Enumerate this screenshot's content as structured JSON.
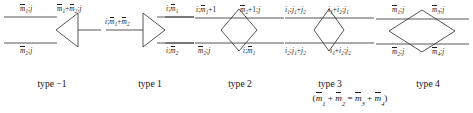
{
  "figure": {
    "kind": "vertex-type-diagram",
    "background": "#ffffff",
    "line_color": "#2b2b2b",
    "text_color": "#1b1b1b"
  },
  "diagrams": [
    {
      "id": "type-minus-1",
      "shape": "left-pointing-triangle",
      "caption": "type −1",
      "labels": {
        "top_left": "m̅1;j",
        "bottom_left": "m̅2;j",
        "right": "m̅1+m̅2;j"
      }
    },
    {
      "id": "type-1",
      "shape": "right-pointing-triangle",
      "caption": "type 1",
      "labels": {
        "left": "i;m̅1+m̅2",
        "top_right": "i;m̅1",
        "bottom_right": "i;m̅2"
      }
    },
    {
      "id": "type-2",
      "shape": "diamond",
      "caption": "type 2",
      "labels": {
        "top_left": "i;m̅1+1",
        "top_right": "m̅2+1;j",
        "bottom_left": "m̅2;j",
        "bottom_right": "i;m̅1"
      }
    },
    {
      "id": "type-3",
      "shape": "diamond",
      "caption": "type 3",
      "labels": {
        "top_left": "i1;j1+j2",
        "top_right": "i1+i2;j1",
        "bottom_left": "i2;j1+j2",
        "bottom_right": "i1+i2;j2"
      }
    },
    {
      "id": "type-4",
      "shape": "wide-diamond",
      "caption": "type 4",
      "labels": {
        "top_left": "m̅1;j",
        "top_right": "m̅3;j",
        "bottom_left": "m̅2;j",
        "bottom_right": "m̅4;j"
      }
    }
  ],
  "captions": {
    "type_minus_1": "type −1",
    "type_1": "type 1",
    "type_2": "type 2",
    "type_3": "type 3",
    "type_4": "type 4",
    "constraint": "(m̅1 + m̅2 = m̅3 + m̅4)"
  }
}
